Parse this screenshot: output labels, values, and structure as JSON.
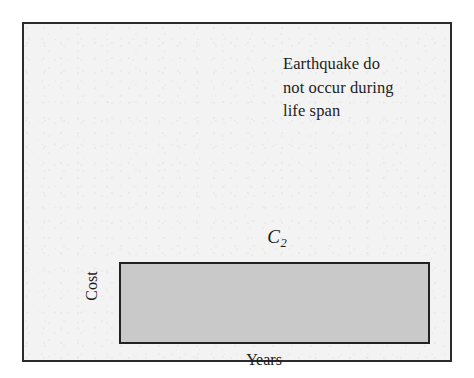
{
  "figure": {
    "annotation": {
      "lines": [
        "Earthquake do",
        "not occur during",
        "life span"
      ]
    },
    "bar_label": {
      "base": "C",
      "subscript": "2"
    },
    "axes": {
      "y_title": "Cost",
      "x_title": "Years"
    },
    "colors": {
      "frame_border": "#2b2b2b",
      "plot_background": "#f3f3f3",
      "bar_fill": "#c9c9c9",
      "bar_border": "#222222",
      "text": "#1d1d1d"
    }
  },
  "chart_data": {
    "type": "bar",
    "title": "",
    "subtitle": "",
    "xlabel": "Years",
    "ylabel": "Cost",
    "categories": [
      "Years"
    ],
    "series": [
      {
        "name": "C2",
        "values": [
          1
        ]
      }
    ],
    "annotations": [
      "Earthquake do not occur during life span"
    ],
    "grid": false,
    "legend_position": "none"
  }
}
